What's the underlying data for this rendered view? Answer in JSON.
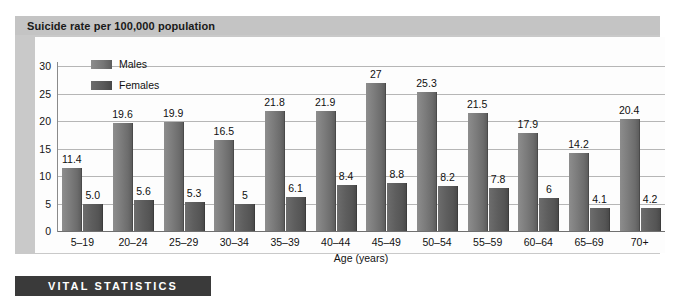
{
  "header": {
    "title": "Suicide rate per 100,000 population"
  },
  "footer": {
    "banner_label": "VITAL STATISTICS"
  },
  "legend": {
    "items": [
      {
        "label": "Males"
      },
      {
        "label": "Females"
      }
    ]
  },
  "axis": {
    "x_title": "Age (years)",
    "y_ticks": [
      "0",
      "5",
      "10",
      "15",
      "20",
      "25",
      "30"
    ]
  },
  "colors": {
    "males_bar": "#7b7b7b",
    "females_bar": "#5a5a5a",
    "title_band": "#c4c4c4",
    "banner": "#3a3a3a",
    "gridline": "#b6b6b6"
  },
  "chart_data": {
    "type": "bar",
    "title": "Suicide rate per 100,000 population",
    "xlabel": "Age (years)",
    "ylabel": "",
    "ylim": [
      0,
      30
    ],
    "ytick_step": 5,
    "grid": true,
    "legend_position": "top-left-inside",
    "categories": [
      "5–19",
      "20–24",
      "25–29",
      "30–34",
      "35–39",
      "40–44",
      "45–49",
      "50–54",
      "55–59",
      "60–64",
      "65–69",
      "70+"
    ],
    "series": [
      {
        "name": "Males",
        "values": [
          11.4,
          19.6,
          19.9,
          16.5,
          21.8,
          21.9,
          27,
          25.3,
          21.5,
          17.9,
          14.2,
          20.4
        ],
        "labels": [
          "11.4",
          "19.6",
          "19.9",
          "16.5",
          "21.8",
          "21.9",
          "27",
          "25.3",
          "21.5",
          "17.9",
          "14.2",
          "20.4"
        ]
      },
      {
        "name": "Females",
        "values": [
          5.0,
          5.6,
          5.3,
          5,
          6.1,
          8.4,
          8.8,
          8.2,
          7.8,
          6,
          4.1,
          4.2
        ],
        "labels": [
          "5.0",
          "5.6",
          "5.3",
          "5",
          "6.1",
          "8.4",
          "8.8",
          "8.2",
          "7.8",
          "6",
          "4.1",
          "4.2"
        ]
      }
    ]
  }
}
